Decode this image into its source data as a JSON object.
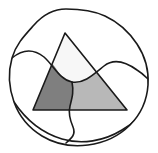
{
  "figure": {
    "title": "Venn-style overlap of an irregular blob and a triangle",
    "width": 158,
    "height": 153,
    "background_color": "#ffffff",
    "stroke_color": "#1a1a1a",
    "stroke_width": 1.6,
    "shapes": {
      "blob": {
        "name": "irregular-blob",
        "fill": "#ffffff",
        "stroke": "#1a1a1a",
        "path": "M 66 9 C 52 9 42 16 34 25 C 25 35 16 44 12 58 C 8 72 9 88 14 102 C 19 116 29 128 42 136 C 55 144 72 147 88 145 C 104 143 119 136 130 125 C 141 114 147 100 148 85 C 149 70 145 56 137 44 C 129 32 118 22 105 16 C 92 10 79 9 66 9 Z"
      },
      "triangle": {
        "name": "triangle",
        "fill": "none",
        "stroke": "#1a1a1a",
        "apex": [
          65,
          33
        ],
        "bottom_left": [
          33,
          110
        ],
        "bottom_right": [
          127,
          110
        ],
        "path": "M 65 33 L 127 110 L 33 110 Z"
      },
      "region_triangle_top": {
        "name": "triangle-above-curve",
        "fill": "#f7f7f7",
        "label": "white upper triangle segment"
      },
      "region_lower_left": {
        "name": "triangle-lower-left",
        "fill": "#7f7f7f",
        "label": "dark gray lower-left segment"
      },
      "region_lower_right": {
        "name": "triangle-lower-right",
        "fill": "#b8b8b8",
        "label": "light gray lower-right segment"
      },
      "wave_curve": {
        "name": "horizontal-wave-curve",
        "stroke": "#1a1a1a",
        "path": "M 12 58 C 24 48 34 49 44 57 C 54 66 60 80 72 82 C 84 84 94 74 104 66 C 114 58 126 62 137 70 C 142 73 145 76 148 79"
      },
      "wiggle_curve": {
        "name": "vertical-wiggle-curve",
        "stroke": "#1a1a1a",
        "path": "M 72 82 C 74 92 72 98 70 106 C 68 114 70 120 73 127 C 76 134 72 138 66 143"
      },
      "bottom_curve": {
        "name": "bottom-arc-curve",
        "stroke": "#1a1a1a",
        "path": "M 14 102 C 26 120 42 133 62 139 C 82 145 104 141 122 130 C 134 123 143 113 148 103"
      }
    },
    "colors": {
      "dark_gray": "#7f7f7f",
      "light_gray": "#b8b8b8",
      "near_white": "#f7f7f7",
      "outline": "#1a1a1a",
      "background": "#ffffff"
    }
  }
}
